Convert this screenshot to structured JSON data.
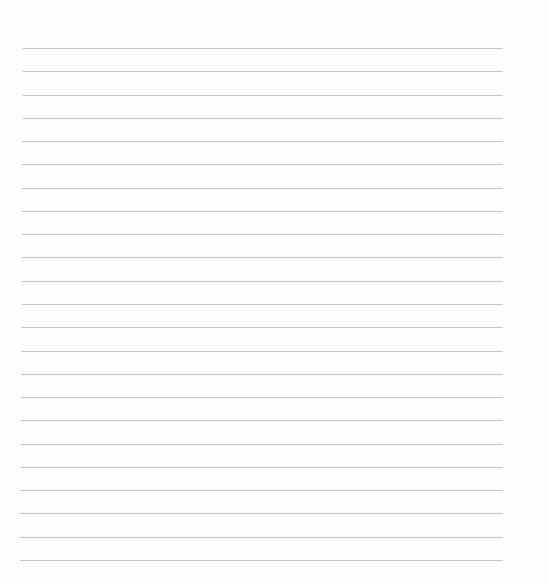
{
  "page": {
    "type": "lined-paper",
    "background": "#fefefe",
    "rule_color": "#c4c4c4",
    "rule_count": 23,
    "first_rule_y": 48,
    "rule_spacing": 23.27,
    "rule_left": 21,
    "rule_right": 503,
    "text": ""
  }
}
